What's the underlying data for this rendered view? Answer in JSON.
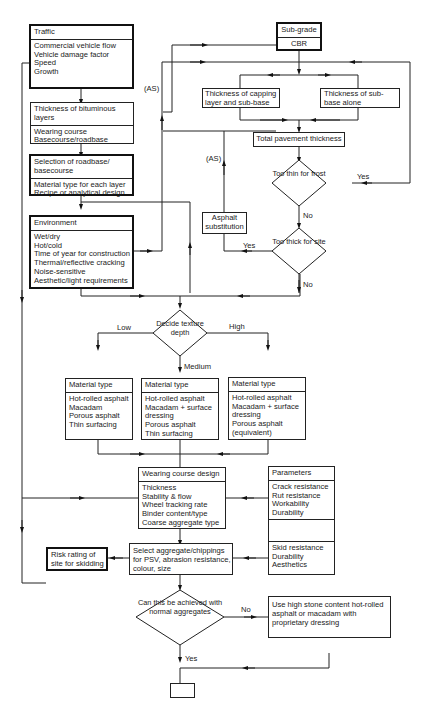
{
  "diagram": {
    "traffic": {
      "title": "Traffic",
      "items": [
        "Commercial vehicle flow",
        "Vehicle damage factor",
        "Speed",
        "Growth"
      ]
    },
    "bituminous": {
      "title_lines": [
        "Thickness of bituminous",
        "layers"
      ],
      "items": [
        "Wearing course",
        "Basecourse/roadbase"
      ]
    },
    "roadbase": {
      "title_lines": [
        "Selection of roadbase/",
        "basecourse"
      ],
      "items": [
        "Material type for each layer",
        "Recipe or analytical design"
      ]
    },
    "environment": {
      "title": "Environment",
      "items": [
        "Wet/dry",
        "Hot/cold",
        "Time of year for construction",
        "Thermal/reflective cracking",
        "Noise-sensitive",
        "Aesthetic/light requirements"
      ]
    },
    "subgrade": {
      "title": "Sub-grade",
      "value": "CBR"
    },
    "capping": {
      "lines": [
        "Thickness of capping",
        "layer and sub-base"
      ]
    },
    "subbase": {
      "lines": [
        "Thickness of sub-",
        "base alone"
      ]
    },
    "total": {
      "label": "Total pavement thickness"
    },
    "frost_decision": {
      "lines": [
        "Too",
        "thin for",
        "frost"
      ],
      "yes": "Yes",
      "no": "No"
    },
    "thick_decision": {
      "lines": [
        "Too",
        "thick for",
        "site"
      ],
      "yes": "Yes",
      "no": "No"
    },
    "asphalt_sub": {
      "lines": [
        "Asphalt",
        "substitution"
      ]
    },
    "as_labels": [
      "(AS)",
      "(AS)"
    ],
    "texture_decision": {
      "lines": [
        "Decide",
        "texture",
        "depth"
      ],
      "low": "Low",
      "medium": "Medium",
      "high": "High"
    },
    "material_low": {
      "title": "Material type",
      "items": [
        "Hot-rolled asphalt",
        "Macadam",
        "Porous asphalt",
        "Thin surfacing"
      ]
    },
    "material_medium": {
      "title": "Material type",
      "items": [
        "Hot-rolled asphalt",
        "Macadam + surface",
        "dressing",
        "Porous asphalt",
        "Thin surfacing"
      ]
    },
    "material_high": {
      "title": "Material type",
      "items": [
        "Hot-rolled asphalt",
        "Macadam + surface",
        "dressing",
        "Porous asphalt",
        "(equivalent)"
      ]
    },
    "wearing_design": {
      "title": "Wearing course design",
      "items": [
        "Thickness",
        "Stability & flow",
        "Wheel tracking rate",
        "Binder content/type",
        "Coarse aggregate type"
      ]
    },
    "parameters": {
      "title": "Parameters",
      "group1": [
        "Crack resistance",
        "Rut resistance",
        "Workability",
        "Durability"
      ],
      "group2": [
        "Skid resistance",
        "Durability",
        "Aesthetics"
      ]
    },
    "select_aggregate": {
      "lines": [
        "Select aggregate/chippings",
        "for PSV, abrasion resistance,",
        "colour, size"
      ]
    },
    "risk_rating": {
      "lines": [
        "Risk rating of",
        "site for skidding"
      ]
    },
    "normal_decision": {
      "lines": [
        "Can",
        "this be",
        "achieved with normal",
        "aggregates"
      ],
      "yes": "Yes",
      "no": "No"
    },
    "high_stone": {
      "lines": [
        "Use high stone content hot-rolled",
        "asphalt  or macadam with",
        "proprietary dressing"
      ]
    },
    "end_box": {
      "label": ""
    }
  }
}
